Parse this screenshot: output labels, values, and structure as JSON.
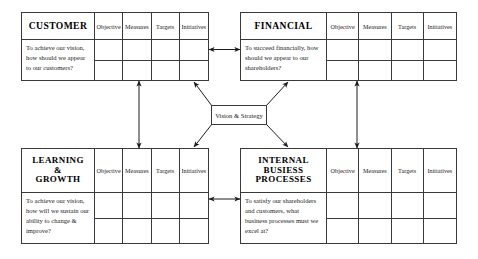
{
  "diagram": {
    "center": {
      "label": "Vision & Strategy"
    },
    "column_headers": [
      "Objective",
      "Measures",
      "Targets",
      "Initiatives"
    ],
    "perspectives": [
      {
        "id": "customer",
        "title": "CUSTOMER",
        "title_lines": [
          "CUSTOMER"
        ],
        "question": "To achieve our vision, how should we appear to our customers?",
        "columns": [
          "Objective",
          "Measures",
          "Targets",
          "Initiatives"
        ],
        "rows": 2
      },
      {
        "id": "financial",
        "title": "FINANCIAL",
        "title_lines": [
          "FINANCIAL"
        ],
        "question": "To succeed financially, how should we appear to our shareholders?",
        "columns": [
          "Objective",
          "Measures",
          "Targets",
          "Initiatives"
        ],
        "rows": 2
      },
      {
        "id": "learning-growth",
        "title": "LEARNING & GROWTH",
        "title_lines": [
          "LEARNING",
          "&",
          "GROWTH"
        ],
        "question": "To achieve our vision, how will we sustain our ability to change & improve?",
        "columns": [
          "Objective",
          "Measures",
          "Targets",
          "Initiatives"
        ],
        "rows": 2
      },
      {
        "id": "internal-business-processes",
        "title": "INTERNAL BUSIESS PROCESSES",
        "title_lines": [
          "INTERNAL",
          "BUSIESS",
          "PROCESSES"
        ],
        "question": "To satisfy our shareholders and customers, what business processes must we excel at?",
        "columns": [
          "Objective",
          "Measures",
          "Targets",
          "Initiatives"
        ],
        "rows": 2
      }
    ],
    "connectors": [
      {
        "id": "customer-financial",
        "kind": "double-arrow",
        "orientation": "horizontal"
      },
      {
        "id": "learning-internal",
        "kind": "double-arrow",
        "orientation": "horizontal"
      },
      {
        "id": "customer-learning",
        "kind": "double-arrow",
        "orientation": "vertical"
      },
      {
        "id": "financial-internal",
        "kind": "double-arrow",
        "orientation": "vertical"
      },
      {
        "id": "vision-customer",
        "kind": "arrow",
        "orientation": "diagonal"
      },
      {
        "id": "vision-financial",
        "kind": "arrow",
        "orientation": "diagonal"
      },
      {
        "id": "vision-learning",
        "kind": "arrow",
        "orientation": "diagonal"
      },
      {
        "id": "vision-internal",
        "kind": "arrow",
        "orientation": "diagonal"
      }
    ],
    "colors": {
      "line": "#3a3a3a",
      "text": "#1c1c1c",
      "background": "#ffffff"
    }
  }
}
